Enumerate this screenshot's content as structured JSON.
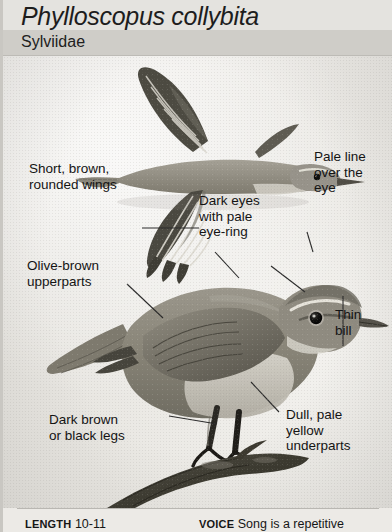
{
  "header": {
    "species_name": "Phylloscopus collybita",
    "family_name": "Sylviidae"
  },
  "illustration": {
    "plate_description": "Grayscale painted plate of a warbler: upper bird in flight with spread barred wings seen from above, lower bird perched on a branch in profile facing right",
    "flying_bird": "flying-bird-illustration",
    "perched_bird": "perched-bird-illustration",
    "branch": "branch-perch"
  },
  "callouts": [
    {
      "id": "wings",
      "text": "Short, brown,\nrounded wings"
    },
    {
      "id": "eye",
      "text": "Dark eyes\nwith pale\neye-ring"
    },
    {
      "id": "supercilium",
      "text": "Pale line\nover the\neye"
    },
    {
      "id": "upperparts",
      "text": "Olive-brown\nupperparts"
    },
    {
      "id": "bill",
      "text": "Thin\nbill"
    },
    {
      "id": "legs",
      "text": "Dark brown\nor black legs"
    },
    {
      "id": "underparts",
      "text": "Dull, pale\nyellow\nunderparts"
    }
  ],
  "footer": {
    "length_label": "LENGTH",
    "length_value": "10-11",
    "voice_label": "VOICE",
    "voice_value": "Song is a repetitive"
  },
  "colors": {
    "page_background": "#eceae6",
    "species_band": "#e4e3df",
    "family_band": "#cfcdc8",
    "text": "#141414",
    "leader_line": "#2a2a2a"
  }
}
